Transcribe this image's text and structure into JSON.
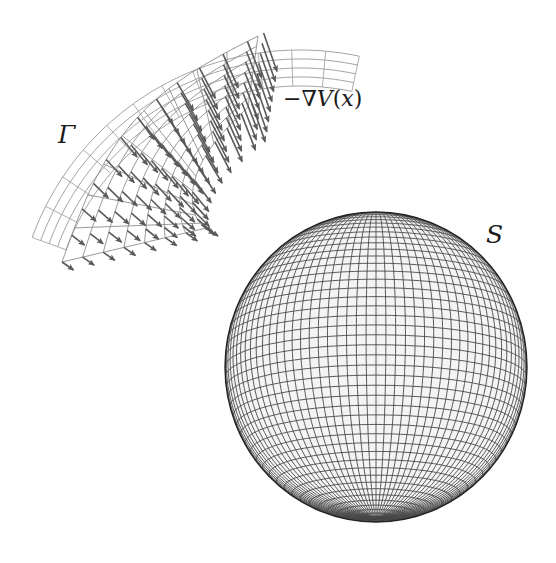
{
  "figure": {
    "labels": {
      "gamma": "Γ",
      "gradient_prefix": "−∇",
      "gradient_fn": "V",
      "gradient_open": "(",
      "gradient_var": "x",
      "gradient_close": ")",
      "sphere": "S"
    },
    "colors": {
      "background": "#ffffff",
      "sphere_grid": "#4a4a4a",
      "sphere_edge": "#222222",
      "patch_rim": "#9a9a9a",
      "patch_grid": "#8c8c8c",
      "arrow": "#5a5a5a",
      "text": "#1a1a1a"
    },
    "sphere": {
      "cx": 376,
      "cy": 367,
      "rx": 151,
      "ry": 155,
      "tilt_deg": 12,
      "meridians": 96,
      "parallels": 48
    },
    "patch": {
      "center_x": 300,
      "center_y": 335,
      "rim_radius": 285,
      "inner_radius": 120,
      "angle_start_deg": 200,
      "angle_end_deg": 282,
      "rim_rows": 4,
      "grid_rows": 7,
      "grid_cols": 9
    }
  }
}
